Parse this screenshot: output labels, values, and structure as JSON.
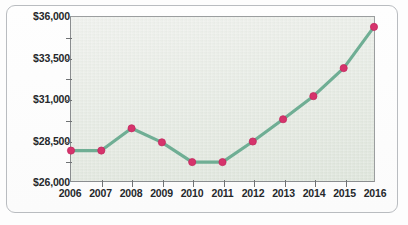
{
  "chart_data": {
    "type": "line",
    "title": "",
    "subtitle": "",
    "xlabel": "",
    "ylabel": "",
    "categories": [
      "2006",
      "2007",
      "2008",
      "2009",
      "2010",
      "2011",
      "2012",
      "2013",
      "2014",
      "2015",
      "2016"
    ],
    "values": [
      27900,
      27900,
      29250,
      28400,
      27200,
      27200,
      28450,
      29800,
      31200,
      32900,
      35400
    ],
    "series": [
      {
        "name": "Value",
        "values": [
          27900,
          27900,
          29250,
          28400,
          27200,
          27200,
          28450,
          29800,
          31200,
          32900,
          35400
        ]
      }
    ],
    "ylim": [
      26000,
      36000
    ],
    "ytick_values": [
      26000,
      28500,
      31000,
      33500,
      36000
    ],
    "ytick_labels": [
      "$26,000",
      "$28,500",
      "$31,000",
      "$33,500",
      "$36,000"
    ],
    "yminor_step": 1250,
    "xtick_labels": [
      "2006",
      "2007",
      "2008",
      "2009",
      "2010",
      "2011",
      "2012",
      "2013",
      "2014",
      "2015",
      "2016"
    ],
    "grid": false,
    "legend": null,
    "legend_position": "none",
    "annotations": []
  },
  "style": {
    "line_color": "#6fae94",
    "marker_color": "#d6336c",
    "marker_edge_color": "#c22a5f",
    "axis_color": "#6f7274",
    "plot_background_top": "#eef0ec",
    "plot_background_bottom": "#dde4da",
    "frame_border_color": "#b9bcc0",
    "page_background": "#fdfdfd",
    "label_color": "#25282b"
  }
}
